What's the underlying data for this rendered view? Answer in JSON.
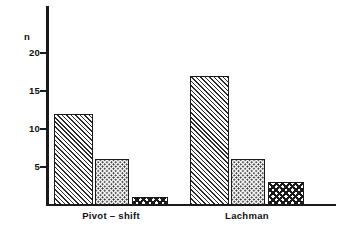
{
  "chart_data": {
    "type": "bar",
    "title": "",
    "subtitle": "",
    "xlabel": "",
    "ylabel": "n",
    "ylim": [
      0,
      22
    ],
    "yticks": [
      5,
      10,
      15,
      20
    ],
    "ytick_labels": [
      "5",
      "10",
      "15",
      "20"
    ],
    "grid": false,
    "legend": "none",
    "categories": [
      "Pivot – shift",
      "Lachman"
    ],
    "series": [
      {
        "name": "series-1",
        "pattern": "diagonal-hatch",
        "values": [
          12,
          17
        ]
      },
      {
        "name": "series-2",
        "pattern": "dots",
        "values": [
          6,
          6
        ]
      },
      {
        "name": "series-3",
        "pattern": "crosshatch",
        "values": [
          1,
          3
        ]
      }
    ],
    "colors": {
      "axis": "#1a1a1a",
      "pattern_ink": "#2b2b2b",
      "bar_fill": "#ffffff",
      "background": "#ffffff",
      "text": "#111111"
    }
  },
  "axis": {
    "y_title": "n",
    "ticks": [
      {
        "value": "20"
      },
      {
        "value": "15"
      },
      {
        "value": "10"
      },
      {
        "value": "5"
      }
    ]
  },
  "groups": [
    {
      "label": "Pivot – shift",
      "bars": [
        {
          "name": "pivot-shift-bar-1",
          "value": 12
        },
        {
          "name": "pivot-shift-bar-2",
          "value": 6
        },
        {
          "name": "pivot-shift-bar-3",
          "value": 1
        }
      ]
    },
    {
      "label": "Lachman",
      "bars": [
        {
          "name": "lachman-bar-1",
          "value": 17
        },
        {
          "name": "lachman-bar-2",
          "value": 6
        },
        {
          "name": "lachman-bar-3",
          "value": 3
        }
      ]
    }
  ]
}
